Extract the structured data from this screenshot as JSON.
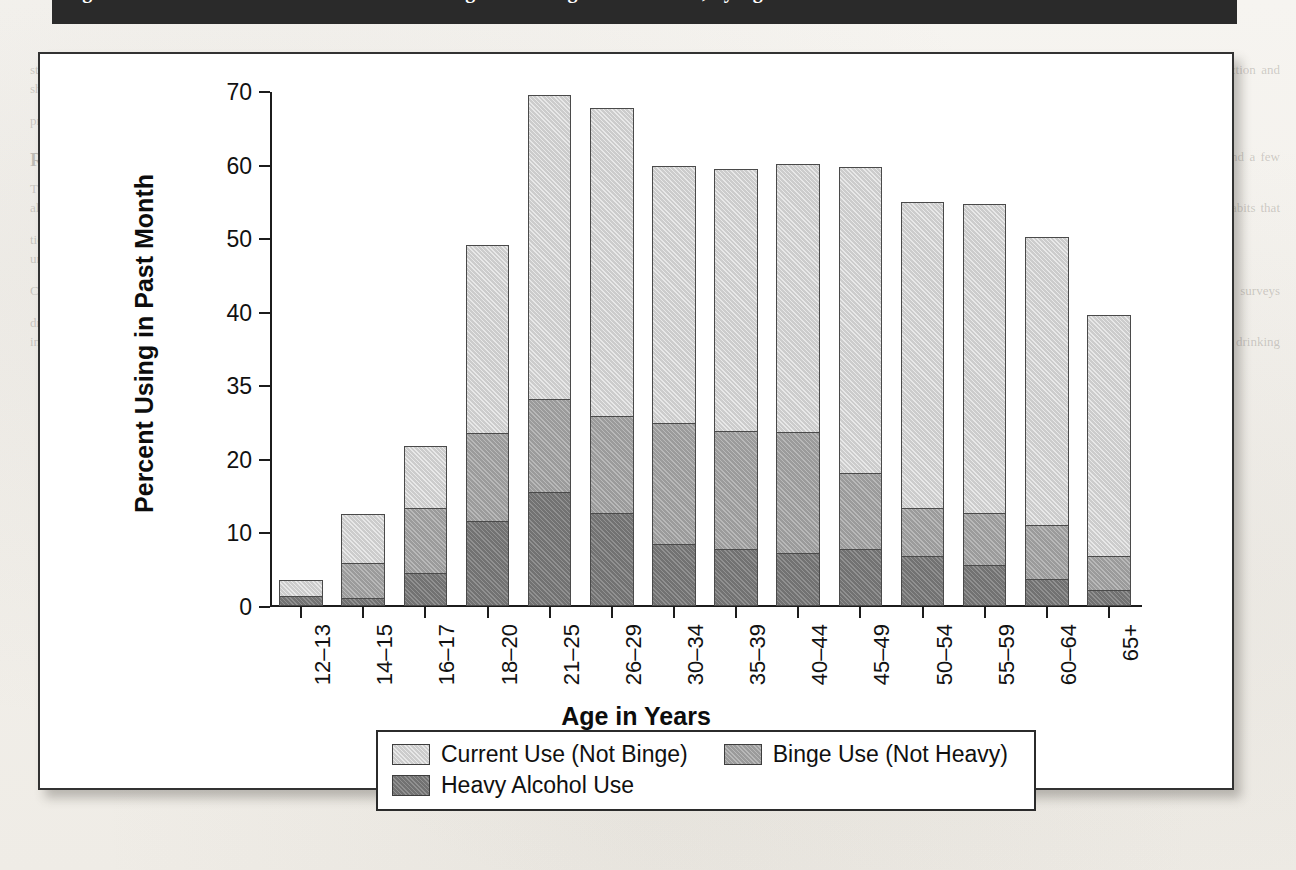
{
  "title_band": {
    "text": "Figure 1.  Alcohol Use in the Past Month among Persons Aged 12 or Older, by Age"
  },
  "ghost_page": {
    "left_column": [
      "statistical research in a different direction and should raise or perhaps lower the",
      "prevalence rates."
    ],
    "left_heading": "Research Gaps",
    "left_body": [
      "The available data on the consumption of alcohol among the young are drawn",
      "from a handful of national surveys and a few regional and local studies. Most of",
      "these estimates rely on self-report measures about behaviors that are socially sanc-",
      "tioned. As a result, estimates may be biased in unknown ways. In some cases, peo-",
      "ple are asked to report on drinking habits that occurred up to a year ago. Recall",
      "bias is likely to occur. There is good reason to believe that reports of the quantity",
      "of alcohol consumed are understated.",
      "Current surveys",
      "Measures of consumption vary from survey to survey, and the full range of",
      "drinking behaviors is not captured in any single instrument.",
      "Response rates for school-based surveys exclude those young people who are",
      "absent or who have dropped out of school. These young people are likely to report",
      "higher rates of alcohol use and heavy drinking than the in-school population."
    ],
    "right_column": [
      "",
      ""
    ]
  },
  "figure": {
    "y_axis_title": "Percent Using in Past Month",
    "x_axis_title": "Age in Years"
  },
  "legend": {
    "items": [
      {
        "label": "Current Use (Not Binge)",
        "color": "#cccccc",
        "key": "current"
      },
      {
        "label": "Binge Use (Not Heavy)",
        "color": "#9b9b9b",
        "key": "binge"
      },
      {
        "label": "Heavy Alcohol Use",
        "color": "#727272",
        "key": "heavy"
      }
    ]
  },
  "chart_data": {
    "type": "bar",
    "subtype": "stacked-vertical",
    "title": "Alcohol Use in the Past Month among Persons Aged 12 or Older, by Age",
    "xlabel": "Age in Years",
    "ylabel": "Percent Using in Past Month",
    "grid": false,
    "legend_position": "bottom",
    "ytick_labels": [
      "0",
      "10",
      "20",
      "35",
      "40",
      "50",
      "60",
      "70"
    ],
    "ytick_values": [
      0,
      10,
      20,
      35,
      40,
      50,
      60,
      70
    ],
    "yaxis_note": "Ordinal (non-linear) tick spacing: ticks are evenly spaced in pixels though the value gaps differ.",
    "ylim": [
      0,
      70
    ],
    "categories": [
      "12–13",
      "14–15",
      "16–17",
      "18–20",
      "21–25",
      "26–29",
      "30–34",
      "35–39",
      "40–44",
      "45–49",
      "50–54",
      "55–59",
      "60–64",
      "65+"
    ],
    "series": [
      {
        "name": "Heavy Alcohol Use",
        "color": "#727272",
        "values": [
          1.3,
          1.1,
          4.5,
          11.6,
          15.5,
          12.7,
          8.4,
          7.8,
          7.2,
          7.8,
          6.8,
          5.6,
          3.7,
          2.2
        ]
      },
      {
        "name": "Binge Use (Not Heavy)",
        "color": "#9b9b9b",
        "values": [
          1.0,
          6.0,
          13.5,
          25.4,
          32.5,
          29.0,
          27.6,
          25.9,
          25.6,
          18.2,
          13.4,
          12.8,
          11.1,
          6.9
        ]
      },
      {
        "name": "Current Use (Not Binge)",
        "color": "#cccccc",
        "values": [
          3.4,
          12.8,
          23.0,
          49.3,
          69.8,
          67.9,
          60.1,
          59.7,
          60.4,
          59.9,
          55.2,
          54.9,
          50.4,
          39.9
        ]
      }
    ],
    "series_note": "Each series value is the cumulative TOP of that segment in the stack (heavy = bottom boundary, binge = heavy+binge, current = full bar total).",
    "bar_totals": [
      3.4,
      12.8,
      23.0,
      49.3,
      69.8,
      67.9,
      60.1,
      59.7,
      60.4,
      59.9,
      55.2,
      54.9,
      50.4,
      39.9
    ]
  }
}
